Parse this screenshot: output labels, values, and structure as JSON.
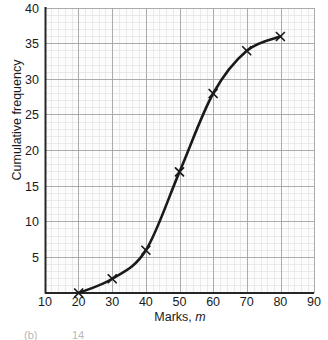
{
  "chart_data": {
    "type": "line",
    "title": "",
    "xlabel": "Marks, m",
    "xlabel_plain": "Marks,",
    "xlabel_italic": "m",
    "ylabel": "Cumulative frequency",
    "xlim": [
      10,
      90
    ],
    "ylim": [
      0,
      40
    ],
    "xticks": [
      10,
      20,
      30,
      40,
      50,
      60,
      70,
      80,
      90
    ],
    "yticks": [
      5,
      10,
      15,
      20,
      25,
      30,
      35,
      40
    ],
    "xtick_labels": [
      "10",
      "20",
      "30",
      "40",
      "50",
      "60",
      "70",
      "80",
      "90"
    ],
    "ytick_labels": [
      "5",
      "10",
      "15",
      "20",
      "25",
      "30",
      "35",
      "40"
    ],
    "x_minor_step": 2,
    "y_minor_step": 1,
    "grid": true,
    "grid_major_color": "#9a9a9a",
    "grid_minor_color": "#d8d8d8",
    "axis_color": "#262626",
    "curve_color": "#1a1a1a",
    "marker": "x",
    "legend": "none",
    "x": [
      20,
      30,
      40,
      50,
      60,
      70,
      80
    ],
    "y": [
      0,
      2,
      6,
      17,
      28,
      34,
      36
    ],
    "points": [
      {
        "x": 20,
        "y": 0
      },
      {
        "x": 30,
        "y": 2
      },
      {
        "x": 40,
        "y": 6
      },
      {
        "x": 50,
        "y": 17
      },
      {
        "x": 60,
        "y": 28
      },
      {
        "x": 70,
        "y": 34
      },
      {
        "x": 80,
        "y": 36
      }
    ]
  },
  "footer": {
    "part_label": "(b)",
    "value": "14"
  }
}
